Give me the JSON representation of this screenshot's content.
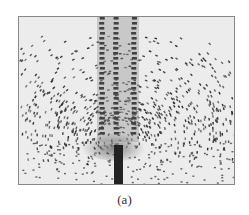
{
  "figure": {
    "caption": "(a)",
    "colors": {
      "background": "#ececec",
      "filings": "#2a2a2a",
      "frame": "#888888",
      "stem": "#222222"
    }
  }
}
